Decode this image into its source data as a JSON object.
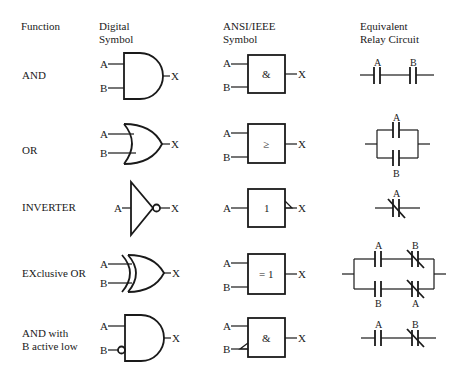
{
  "headers": {
    "function": "Function",
    "digital_line1": "Digital",
    "digital_line2": "Symbol",
    "ansi_line1": "ANSI/IEEE",
    "ansi_line2": "Symbol",
    "relay_line1": "Equivalent",
    "relay_line2": "Relay Circuit"
  },
  "rows": [
    {
      "function": "AND",
      "ansi_label": "&",
      "inputs": [
        "A",
        "B"
      ],
      "output": "X",
      "relay_labels": [
        "A",
        "B"
      ]
    },
    {
      "function": "OR",
      "ansi_label": "≥",
      "inputs": [
        "A",
        "B"
      ],
      "output": "X",
      "relay_labels": [
        "A",
        "B"
      ]
    },
    {
      "function": "INVERTER",
      "ansi_label": "1",
      "inputs": [
        "A"
      ],
      "output": "X",
      "relay_labels": [
        "A"
      ]
    },
    {
      "function": "EXclusive OR",
      "ansi_label": "= 1",
      "inputs": [
        "A",
        "B"
      ],
      "output": "X",
      "relay_labels": [
        "A",
        "B",
        "B",
        "A"
      ]
    },
    {
      "function_line1": "AND with",
      "function_line2": "B active low",
      "ansi_label": "&",
      "inputs": [
        "A",
        "B"
      ],
      "output": "X",
      "relay_labels": [
        "A",
        "B"
      ]
    }
  ]
}
